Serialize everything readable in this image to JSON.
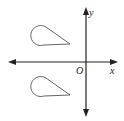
{
  "diagram": {
    "type": "coordinate-plane",
    "labels": {
      "x_axis": "x",
      "y_axis": "y",
      "origin": "O"
    },
    "shapes": [
      {
        "name": "upper-teardrop",
        "quadrant": "II"
      },
      {
        "name": "lower-teardrop",
        "quadrant": "III"
      }
    ],
    "colors": {
      "axis": "#222222",
      "shape_stroke": "#555555",
      "background": "#ffffff"
    }
  }
}
